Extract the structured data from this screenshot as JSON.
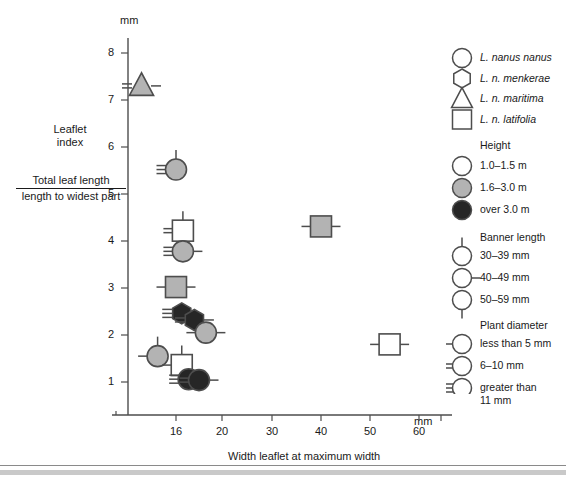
{
  "figure": {
    "y_unit_label": "mm",
    "x_unit_label": "mm",
    "x_title": "Width leaflet at maximum width",
    "y_caption_line1": "Leaflet",
    "y_caption_line2": "index",
    "y_caption_numerator": "Total leaf length",
    "y_caption_denominator": "length to widest part"
  },
  "legend": {
    "taxa": [
      {
        "label": "L. nanus nanus",
        "shape": "circle",
        "icon": "circle-outline-icon"
      },
      {
        "label": "L. n. menkerae",
        "shape": "hexagon",
        "icon": "hexagon-outline-icon"
      },
      {
        "label": "L. n. maritima",
        "shape": "triangle",
        "icon": "triangle-outline-icon"
      },
      {
        "label": "L. n. latifolia",
        "shape": "square",
        "icon": "square-outline-icon"
      }
    ],
    "height_title": "Height",
    "height": [
      {
        "label": "1.0–1.5 m",
        "fill": "#ffffff",
        "icon": "circle-white-icon"
      },
      {
        "label": "1.6–3.0 m",
        "fill": "#b3b3b3",
        "icon": "circle-gray-icon"
      },
      {
        "label": "over 3.0 m",
        "fill": "#262626",
        "icon": "circle-black-icon"
      }
    ],
    "banner_title": "Banner length",
    "banner": [
      {
        "label": "30–39 mm",
        "mark": "top-tick",
        "icon": "circle-top-tick-icon"
      },
      {
        "label": "40–49 mm",
        "mark": "side-tick",
        "icon": "circle-side-tick-icon"
      },
      {
        "label": "50–59 mm",
        "mark": "bottom-tick",
        "icon": "circle-bottom-tick-icon"
      }
    ],
    "diameter_title": "Plant diameter",
    "diameter": [
      {
        "label": "less than 5 mm",
        "lines": 1,
        "icon": "circle-one-line-icon"
      },
      {
        "label": "6–10 mm",
        "lines": 2,
        "icon": "circle-two-lines-icon"
      },
      {
        "label": "greater than",
        "label2": "11 mm",
        "lines": 3,
        "icon": "circle-three-lines-icon"
      }
    ]
  },
  "chart_data": {
    "type": "scatter",
    "title": "",
    "xlabel": "Width leaflet at maximum width",
    "ylabel": "Leaflet index = Total leaf length / length to widest part",
    "x_unit": "mm",
    "y_unit": "mm",
    "grid": false,
    "legend_position": "right",
    "xticks": [
      16,
      20,
      30,
      40,
      50,
      60
    ],
    "xtick_labels": [
      "16",
      "20",
      "30",
      "40",
      "50",
      "60"
    ],
    "xtick_px": [
      176,
      222,
      272,
      321,
      370,
      419
    ],
    "x_axis_note": "non-linear: compressed below 20 mm",
    "yticks": [
      1,
      2,
      3,
      4,
      5,
      6,
      7,
      8
    ],
    "ytick_labels": [
      "1",
      "2",
      "3",
      "4",
      "5",
      "6",
      "7",
      "8"
    ],
    "ylim": [
      0.6,
      8.4
    ],
    "points": [
      {
        "x": 13.0,
        "y": 7.3,
        "shape": "triangle",
        "fill": "#b3b3b3",
        "banner": "side-tick",
        "diameter_lines": 2,
        "taxon": "L. n. maritima",
        "height": "1.6–3.0 m"
      },
      {
        "x": 16.0,
        "y": 5.52,
        "shape": "circle",
        "fill": "#b3b3b3",
        "banner": "top-tick",
        "diameter_lines": 3,
        "taxon": "L. nanus nanus",
        "height": "1.6–3.0 m"
      },
      {
        "x": 16.6,
        "y": 4.22,
        "shape": "square",
        "fill": "#ffffff",
        "banner": "top-tick",
        "diameter_lines": 2,
        "taxon": "L. n. latifolia",
        "height": "1.0–1.5 m"
      },
      {
        "x": 16.6,
        "y": 3.78,
        "shape": "circle",
        "fill": "#b3b3b3",
        "banner": "side-tick",
        "diameter_lines": 3,
        "taxon": "L. nanus nanus",
        "height": "1.6–3.0 m"
      },
      {
        "x": 16.0,
        "y": 3.02,
        "shape": "square",
        "fill": "#b3b3b3",
        "banner": "side-tick",
        "diameter_lines": 1,
        "taxon": "L. n. latifolia",
        "height": "1.6–3.0 m"
      },
      {
        "x": 16.5,
        "y": 2.46,
        "shape": "hexagon",
        "fill": "#262626",
        "banner": "side-tick",
        "diameter_lines": 3,
        "taxon": "L. n. menkerae",
        "height": "over 3.0 m"
      },
      {
        "x": 17.6,
        "y": 2.32,
        "shape": "hexagon",
        "fill": "#262626",
        "banner": "side-tick",
        "diameter_lines": 2,
        "taxon": "L. n. menkerae",
        "height": "over 3.0 m"
      },
      {
        "x": 18.6,
        "y": 2.05,
        "shape": "circle",
        "fill": "#b3b3b3",
        "banner": "side-tick",
        "diameter_lines": 1,
        "taxon": "L. nanus nanus",
        "height": "1.6–3.0 m"
      },
      {
        "x": 14.4,
        "y": 1.55,
        "shape": "circle",
        "fill": "#b3b3b3",
        "banner": "top-tick",
        "diameter_lines": 1,
        "taxon": "L. nanus nanus",
        "height": "1.6–3.0 m"
      },
      {
        "x": 16.5,
        "y": 1.36,
        "shape": "square",
        "fill": "#ffffff",
        "banner": "top-tick",
        "diameter_lines": 1,
        "taxon": "L. n. latifolia",
        "height": "1.0–1.5 m"
      },
      {
        "x": 17.1,
        "y": 1.06,
        "shape": "circle",
        "fill": "#262626",
        "banner": "side-tick",
        "diameter_lines": 3,
        "taxon": "L. nanus nanus",
        "height": "over 3.0 m"
      },
      {
        "x": 18.0,
        "y": 1.04,
        "shape": "circle",
        "fill": "#262626",
        "banner": "side-tick",
        "diameter_lines": 2,
        "taxon": "L. nanus nanus",
        "height": "over 3.0 m"
      },
      {
        "x": 40.0,
        "y": 4.31,
        "shape": "square",
        "fill": "#b3b3b3",
        "banner": "side-tick",
        "diameter_lines": 1,
        "taxon": "L. n. latifolia",
        "height": "1.6–3.0 m"
      },
      {
        "x": 54.0,
        "y": 1.8,
        "shape": "square",
        "fill": "#ffffff",
        "banner": "side-tick",
        "diameter_lines": 1,
        "taxon": "L. n. latifolia",
        "height": "1.0–1.5 m"
      }
    ]
  }
}
